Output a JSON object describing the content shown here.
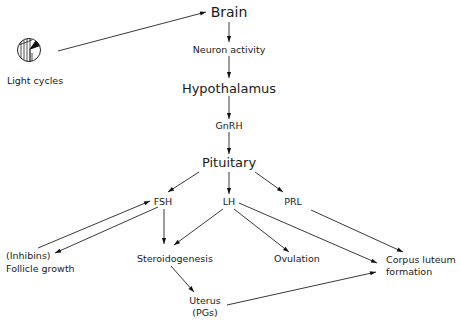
{
  "diagram": {
    "type": "flowchart",
    "nodes": {
      "light_cycles": "Light cycles",
      "brain": "Brain",
      "neuron_activity": "Neuron activity",
      "hypothalamus": "Hypothalamus",
      "gnrh": "GnRH",
      "pituitary": "Pituitary",
      "fsh": "FSH",
      "lh": "LH",
      "prl": "PRL",
      "inhibins": "(Inhibins)",
      "follicle_growth": "Follicle growth",
      "steroidogenesis": "Steroidogenesis",
      "ovulation": "Ovulation",
      "corpus_luteum_1": "Corpus luteum",
      "corpus_luteum_2": "formation",
      "uterus_1": "Uterus",
      "uterus_2": "(PGs)"
    },
    "icons": {
      "light_cycles_icon": "half-hatched-circle-with-wedge"
    },
    "edges": [
      {
        "from": "Light cycles",
        "to": "Brain"
      },
      {
        "from": "Brain",
        "to": "Neuron activity"
      },
      {
        "from": "Neuron activity",
        "to": "Hypothalamus"
      },
      {
        "from": "Hypothalamus",
        "to": "GnRH"
      },
      {
        "from": "GnRH",
        "to": "Pituitary"
      },
      {
        "from": "Pituitary",
        "to": "FSH"
      },
      {
        "from": "Pituitary",
        "to": "LH"
      },
      {
        "from": "Pituitary",
        "to": "PRL"
      },
      {
        "from": "(Inhibins)",
        "to": "FSH"
      },
      {
        "from": "FSH",
        "to": "Follicle growth"
      },
      {
        "from": "FSH",
        "to": "Steroidogenesis"
      },
      {
        "from": "LH",
        "to": "Steroidogenesis"
      },
      {
        "from": "LH",
        "to": "Ovulation"
      },
      {
        "from": "LH",
        "to": "Corpus luteum formation"
      },
      {
        "from": "PRL",
        "to": "Corpus luteum formation"
      },
      {
        "from": "Steroidogenesis",
        "to": "Uterus (PGs)"
      },
      {
        "from": "Uterus (PGs)",
        "to": "Corpus luteum formation"
      }
    ]
  }
}
